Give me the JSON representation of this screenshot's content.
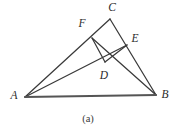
{
  "figure": {
    "caption": "(a)",
    "background_color": "#ffffff",
    "stroke_color": "#3a3a3a",
    "baseline_color": "#555555",
    "label_color": "#2b2b2b",
    "points": [
      {
        "name": "A",
        "label": "A",
        "x": 25,
        "y": 97,
        "label_x": 14,
        "label_y": 96
      },
      {
        "name": "B",
        "label": "B",
        "x": 156,
        "y": 95,
        "label_x": 165,
        "label_y": 95
      },
      {
        "name": "C",
        "label": "C",
        "x": 110,
        "y": 19,
        "label_x": 112,
        "label_y": 8
      },
      {
        "name": "D",
        "label": "D",
        "x": 105,
        "y": 62,
        "label_x": 104,
        "label_y": 76
      },
      {
        "name": "E",
        "label": "E",
        "x": 127,
        "y": 45,
        "label_x": 135,
        "label_y": 39
      },
      {
        "name": "F",
        "label": "F",
        "x": 92,
        "y": 38,
        "label_x": 82,
        "label_y": 24
      }
    ],
    "segments": [
      {
        "name": "segment-A-C",
        "from": "A",
        "to": "C"
      },
      {
        "name": "segment-A-B",
        "from": "A",
        "to": "B"
      },
      {
        "name": "segment-A-E",
        "from": "A",
        "to": "E"
      },
      {
        "name": "segment-C-B",
        "from": "C",
        "to": "B"
      },
      {
        "name": "segment-F-B",
        "from": "F",
        "to": "B"
      },
      {
        "name": "segment-F-D",
        "from": "F",
        "to": "D"
      },
      {
        "name": "segment-D-E",
        "from": "D",
        "to": "E"
      }
    ]
  }
}
